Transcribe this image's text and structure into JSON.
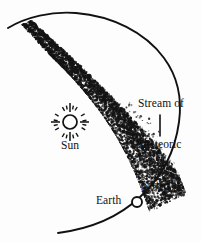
{
  "figure": {
    "background_color": "#fdfdfd",
    "ink_color": "#111111"
  },
  "labels": {
    "stream_line1": "Stream of",
    "stream_line2": "meteoric",
    "stream_line3": "particles",
    "sun": "Sun",
    "earth": "Earth"
  },
  "chart_data": {
    "type": "diagram",
    "title": "Stream of meteoric particles",
    "elements": [
      {
        "name": "earth-orbit-arc",
        "kind": "arc",
        "stroke": "#111111",
        "stroke_width": 1.9,
        "description": "Large open arc representing Earth's orbit around the Sun, sweeping from upper-left, over the top, down the right side and back to lower-left"
      },
      {
        "name": "meteor-stream-band",
        "kind": "stippled-band",
        "stroke": "#111111",
        "description": "Dense band of small dark specks, narrow at upper-left and fanning out wide at the lower-right, crossing the orbit near Earth"
      },
      {
        "name": "sun-symbol",
        "kind": "circle-with-rays",
        "center": [
          70,
          122
        ],
        "radius": 7,
        "long_rays": 4,
        "short_rays": 16
      },
      {
        "name": "earth-marker",
        "kind": "open-circle",
        "center": [
          137,
          202
        ],
        "radius": 5
      },
      {
        "name": "leader-line",
        "kind": "line",
        "description": "Short line from the stream label down toward the particle stream"
      }
    ],
    "xlabel": "",
    "ylabel": "",
    "grid": false,
    "legend": "none"
  }
}
